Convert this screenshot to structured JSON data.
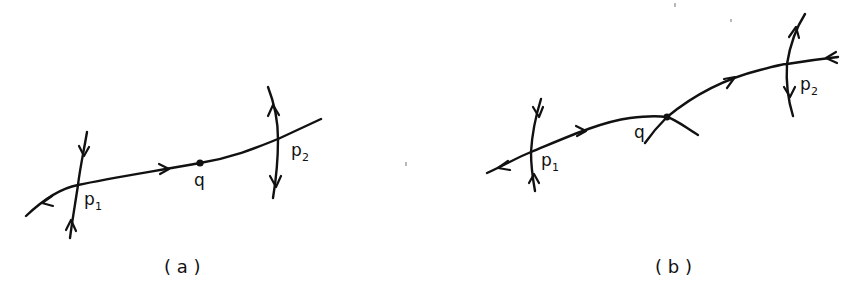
{
  "figure": {
    "panels": [
      {
        "id": "a",
        "caption": "( a )",
        "points": {
          "p1": {
            "label": "p",
            "sub": "1"
          },
          "q": {
            "label": "q"
          },
          "p2": {
            "label": "p",
            "sub": "2"
          }
        }
      },
      {
        "id": "b",
        "caption": "( b )",
        "points": {
          "p1": {
            "label": "p",
            "sub": "1"
          },
          "q": {
            "label": "q"
          },
          "p2": {
            "label": "p",
            "sub": "2"
          }
        }
      }
    ]
  },
  "colors": {
    "stroke": "#111111",
    "background": "#ffffff"
  }
}
